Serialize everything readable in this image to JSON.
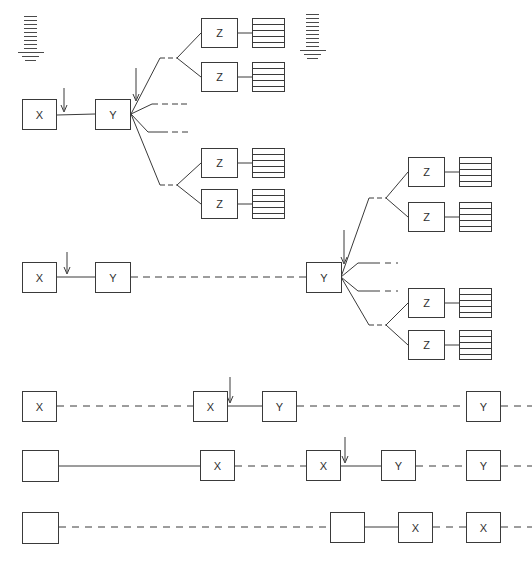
{
  "page": {
    "width": 532,
    "height": 564,
    "background": "#ffffff",
    "ink_color": "#3a3a3a",
    "faint_color": "#b9b9b9"
  },
  "corner_label": {
    "text": ""
  },
  "bottom_caption": {
    "text": ""
  },
  "scale_marks": [
    {
      "name": "scale-mark-left",
      "x": 18,
      "y": 16,
      "ticks": 13
    },
    {
      "name": "scale-mark-right",
      "x": 300,
      "y": 14,
      "ticks": 13
    }
  ],
  "trees": [
    {
      "name": "tree-upper",
      "root_label": "X",
      "stage2_label": "Y",
      "leaf_label": "Z",
      "arrows": [
        {
          "name": "arrow-into-x",
          "x": 64,
          "y": 88,
          "length": 22
        },
        {
          "name": "arrow-into-y",
          "x": 135,
          "y": 68,
          "length": 30
        }
      ],
      "leaves": [
        "Z",
        "Z",
        "Z",
        "Z"
      ],
      "stub_branches": 2
    },
    {
      "name": "tree-lower",
      "root_label": "X",
      "stage2_label": "Y",
      "leaf_label": "Z",
      "arrows": [
        {
          "name": "arrow-into-x",
          "x": 67,
          "y": 252,
          "length": 22
        },
        {
          "name": "arrow-into-y",
          "x": 344,
          "y": 230,
          "length": 30
        }
      ],
      "leaves": [
        "Z",
        "Z",
        "Z",
        "Z"
      ],
      "stub_branches": 2
    }
  ],
  "chains": [
    {
      "name": "chain-row-1",
      "nodes": [
        {
          "label": "X",
          "x": 22,
          "y": 391
        },
        {
          "label": "X",
          "x": 193,
          "y": 391
        },
        {
          "label": "Y",
          "x": 262,
          "y": 391
        },
        {
          "label": "Y",
          "x": 466,
          "y": 391
        }
      ],
      "arrow": {
        "name": "arrow-row-1",
        "x": 230,
        "y": 372,
        "length": 22
      }
    },
    {
      "name": "chain-row-2",
      "nodes": [
        {
          "label": "",
          "x": 22,
          "y": 450
        },
        {
          "label": "X",
          "x": 200,
          "y": 450
        },
        {
          "label": "X",
          "x": 306,
          "y": 450
        },
        {
          "label": "Y",
          "x": 381,
          "y": 450
        },
        {
          "label": "Y",
          "x": 466,
          "y": 450
        }
      ],
      "arrow": {
        "name": "arrow-row-2",
        "x": 345,
        "y": 431,
        "length": 22
      }
    },
    {
      "name": "chain-row-3",
      "nodes": [
        {
          "label": "",
          "x": 22,
          "y": 512
        },
        {
          "label": "",
          "x": 330,
          "y": 512
        },
        {
          "label": "X",
          "x": 398,
          "y": 512
        },
        {
          "label": "X",
          "x": 466,
          "y": 512
        }
      ],
      "arrow": null
    }
  ],
  "labels": {
    "x": "X",
    "y": "Y",
    "z": "Z",
    "empty": ""
  }
}
